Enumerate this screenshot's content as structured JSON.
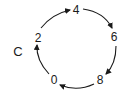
{
  "diagram": {
    "type": "cycle",
    "label": "C",
    "direction": "clockwise",
    "nodes": [
      {
        "id": "n2",
        "label": "2",
        "x": 38,
        "y": 37
      },
      {
        "id": "n4",
        "label": "4",
        "x": 76,
        "y": 10
      },
      {
        "id": "n6",
        "label": "6",
        "x": 114,
        "y": 37
      },
      {
        "id": "n8",
        "label": "8",
        "x": 100,
        "y": 80
      },
      {
        "id": "n0",
        "label": "0",
        "x": 54,
        "y": 80
      }
    ],
    "edges": [
      {
        "from": "2",
        "to": "4"
      },
      {
        "from": "4",
        "to": "6"
      },
      {
        "from": "6",
        "to": "8"
      },
      {
        "from": "8",
        "to": "0"
      },
      {
        "from": "0",
        "to": "2"
      }
    ],
    "colors": {
      "stroke": "#1a1a1a",
      "background": "#ffffff"
    }
  }
}
